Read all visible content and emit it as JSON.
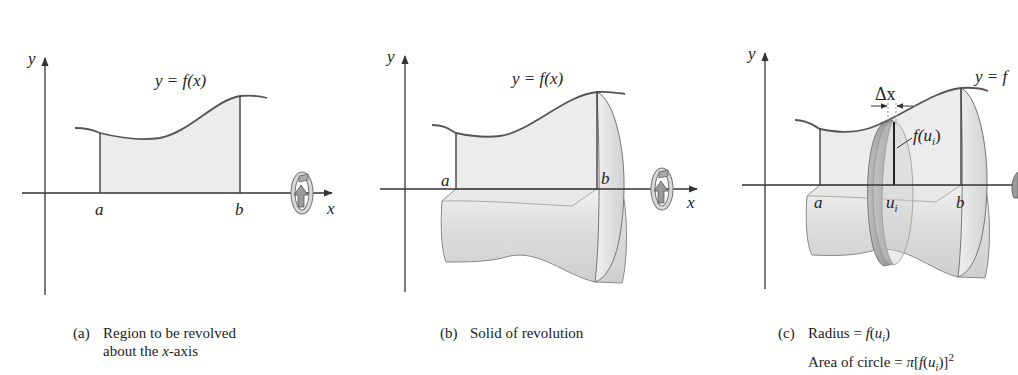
{
  "figure": {
    "panels": [
      {
        "id": "a",
        "axis_labels": {
          "x": "x",
          "y": "y"
        },
        "curve_label": "y = f(x)",
        "bound_labels": {
          "left": "a",
          "right": "b"
        },
        "caption": {
          "tag": "(a)",
          "line1": "Region to be revolved",
          "line2_pre": "about the ",
          "line2_it": "x",
          "line2_post": "-axis"
        }
      },
      {
        "id": "b",
        "axis_labels": {
          "x": "x",
          "y": "y"
        },
        "curve_label": "y = f(x)",
        "bound_labels": {
          "left": "a",
          "right": "b"
        },
        "caption": {
          "tag": "(b)",
          "line1": "Solid of revolution"
        }
      },
      {
        "id": "c",
        "axis_labels": {
          "y": "y"
        },
        "curve_label": "y = f",
        "bound_labels": {
          "left": "a",
          "mid": "u",
          "mid_sub": "i",
          "right": "b"
        },
        "slice_width_label": "Δx",
        "radius_label": "f(u",
        "radius_sub": "i",
        "radius_close": ")",
        "caption": {
          "tag": "(c)",
          "line1_pre": "Radius = ",
          "line1_it": "f",
          "line1_mid": "(",
          "line1_u": "u",
          "line1_sub": "i",
          "line1_post": ")",
          "line2_pre": "Area of circle = ",
          "line2_pi": "π",
          "line2_mid": "[",
          "line2_f": "f",
          "line2_open": "(",
          "line2_u": "u",
          "line2_sub": "i",
          "line2_close": ")]",
          "line2_sup": "2"
        }
      }
    ],
    "colors": {
      "axis": "#333333",
      "curve": "#555555",
      "region_fill": "#ececec",
      "solid_fill": "#e2e2e2",
      "solid_shade": "#c8c8c8"
    }
  }
}
